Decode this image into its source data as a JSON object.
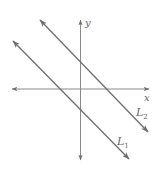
{
  "diagram": {
    "type": "coordinate-plane-parallel-lines",
    "axes": {
      "x_label": "x",
      "y_label": "y",
      "color": "#7a7a7a"
    },
    "lines": [
      {
        "name": "L_1",
        "label_main": "L",
        "label_sub": "1",
        "color": "#6e6e6e",
        "description": "lower-left parallel line with negative slope"
      },
      {
        "name": "L_2",
        "label_main": "L",
        "label_sub": "2",
        "color": "#6e6e6e",
        "description": "upper-right parallel line with negative slope"
      }
    ]
  }
}
